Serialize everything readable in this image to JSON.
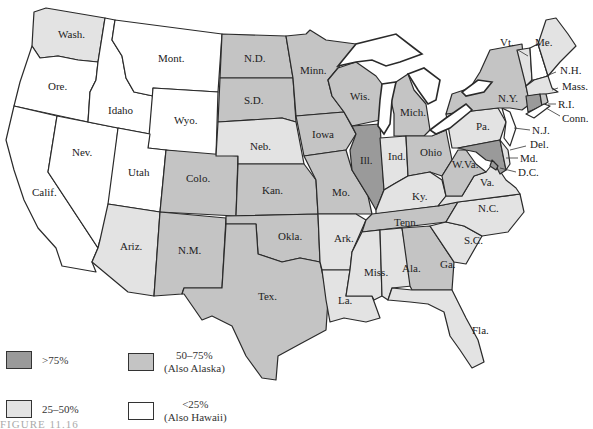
{
  "figure": {
    "caption": "FIGURE 11.16"
  },
  "colors": {
    "gt75": "#9a9a9a",
    "c50_75": "#c4c4c4",
    "c25_50": "#e3e3e3",
    "lt25": "#ffffff"
  },
  "legend": [
    {
      "key": "gt75",
      "label": ">75%",
      "note": ""
    },
    {
      "key": "c50_75",
      "label": "50–75%",
      "note": "(Also Alaska)"
    },
    {
      "key": "c25_50",
      "label": "25–50%",
      "note": ""
    },
    {
      "key": "lt25",
      "label": "<25%",
      "note": "(Also Hawaii)"
    }
  ],
  "states": {
    "wash": {
      "label": "Wash.",
      "category": "25-50%"
    },
    "ore": {
      "label": "Ore.",
      "category": "<25%"
    },
    "calif": {
      "label": "Calif.",
      "category": "<25%"
    },
    "nev": {
      "label": "Nev.",
      "category": "<25%"
    },
    "idaho": {
      "label": "Idaho",
      "category": "<25%"
    },
    "mont": {
      "label": "Mont.",
      "category": "<25%"
    },
    "wyo": {
      "label": "Wyo.",
      "category": "<25%"
    },
    "utah": {
      "label": "Utah",
      "category": "<25%"
    },
    "colo": {
      "label": "Colo.",
      "category": "50-75%"
    },
    "ariz": {
      "label": "Ariz.",
      "category": "25-50%"
    },
    "nm": {
      "label": "N.M.",
      "category": "50-75%"
    },
    "nd": {
      "label": "N.D.",
      "category": "50-75%"
    },
    "sd": {
      "label": "S.D.",
      "category": "50-75%"
    },
    "neb": {
      "label": "Neb.",
      "category": "25-50%"
    },
    "kan": {
      "label": "Kan.",
      "category": "50-75%"
    },
    "okla": {
      "label": "Okla.",
      "category": "50-75%"
    },
    "tex": {
      "label": "Tex.",
      "category": "50-75%"
    },
    "minn": {
      "label": "Minn.",
      "category": "50-75%"
    },
    "iowa": {
      "label": "Iowa",
      "category": "50-75%"
    },
    "mo": {
      "label": "Mo.",
      "category": "50-75%"
    },
    "ark": {
      "label": "Ark.",
      "category": "25-50%"
    },
    "la": {
      "label": "La.",
      "category": "25-50%"
    },
    "wis": {
      "label": "Wis.",
      "category": "50-75%"
    },
    "ill": {
      "label": "Ill.",
      "category": ">75%"
    },
    "mich": {
      "label": "Mich.",
      "category": "50-75%"
    },
    "ind": {
      "label": "Ind.",
      "category": "25-50%"
    },
    "ohio": {
      "label": "Ohio",
      "category": "50-75%"
    },
    "ky": {
      "label": "Ky.",
      "category": "25-50%"
    },
    "tenn": {
      "label": "Tenn.",
      "category": "50-75%"
    },
    "miss": {
      "label": "Miss.",
      "category": "25-50%"
    },
    "ala": {
      "label": "Ala.",
      "category": "25-50%"
    },
    "ga": {
      "label": "Ga.",
      "category": "50-75%"
    },
    "fla": {
      "label": "Fla.",
      "category": "25-50%"
    },
    "sc": {
      "label": "S.C.",
      "category": "25-50%"
    },
    "nc": {
      "label": "N.C.",
      "category": "25-50%"
    },
    "va": {
      "label": "Va.",
      "category": "25-50%"
    },
    "wva": {
      "label": "W.Va.",
      "category": "50-75%"
    },
    "md": {
      "label": "Md.",
      "category": ">75%"
    },
    "del": {
      "label": "Del.",
      "category": "25-50%"
    },
    "dc": {
      "label": "D.C.",
      "category": ">75%"
    },
    "nj": {
      "label": "N.J.",
      "category": "<25%"
    },
    "pa": {
      "label": "Pa.",
      "category": "25-50%"
    },
    "ny": {
      "label": "N.Y.",
      "category": "50-75%"
    },
    "vt": {
      "label": "Vt.",
      "category": "25-50%"
    },
    "nh": {
      "label": "N.H.",
      "category": "<25%"
    },
    "me": {
      "label": "Me.",
      "category": "25-50%"
    },
    "mass": {
      "label": "Mass.",
      "category": "25-50%"
    },
    "ri": {
      "label": "R.I.",
      "category": "50-75%"
    },
    "conn": {
      "label": "Conn.",
      "category": ">75%"
    }
  }
}
